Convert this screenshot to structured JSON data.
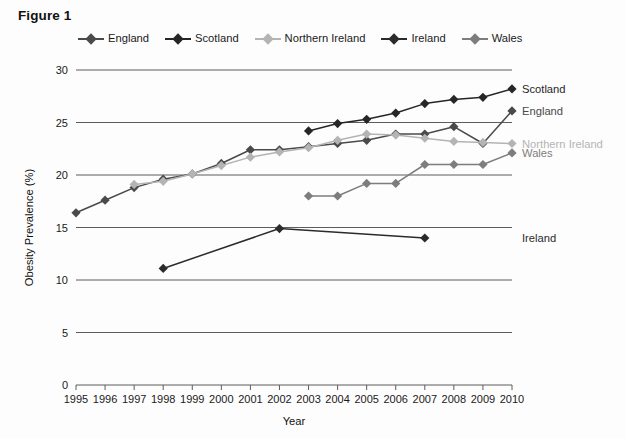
{
  "figure": {
    "title": "Figure 1"
  },
  "legend": {
    "items": [
      {
        "label": "England",
        "color": "#4a4a4a"
      },
      {
        "label": "Scotland",
        "color": "#262626"
      },
      {
        "label": "Northern Ireland",
        "color": "#b4b4b4"
      },
      {
        "label": "Ireland",
        "color": "#2b2b2b"
      },
      {
        "label": "Wales",
        "color": "#7d7d7d"
      }
    ]
  },
  "end_labels": [
    {
      "name": "Scotland",
      "value": 28.2,
      "color": "#262626"
    },
    {
      "name": "England",
      "value": 26.1,
      "color": "#4a4a4a"
    },
    {
      "name": "Northern Ireland",
      "value": 23.0,
      "color": "#b4b4b4"
    },
    {
      "name": "Wales",
      "value": 22.1,
      "color": "#7d7d7d"
    },
    {
      "name": "Ireland",
      "value": 14.0,
      "color": "#2b2b2b"
    }
  ],
  "chart_data": {
    "type": "line",
    "title": "Figure 1",
    "xlabel": "Year",
    "ylabel": "Obesity Prevalence (%)",
    "x": [
      1995,
      1996,
      1997,
      1998,
      1999,
      2000,
      2001,
      2002,
      2003,
      2004,
      2005,
      2006,
      2007,
      2008,
      2009,
      2010
    ],
    "xlim": [
      1995,
      2010
    ],
    "ylim": [
      0,
      30
    ],
    "yticks": [
      0,
      5,
      10,
      15,
      20,
      25,
      30
    ],
    "xticks": [
      "1995",
      "1996",
      "1997",
      "1998",
      "1999",
      "2000",
      "2001",
      "2002",
      "2003",
      "2004",
      "2005",
      "2006",
      "2007",
      "2008",
      "2009",
      "2010"
    ],
    "grid": "horizontal",
    "legend_position": "top",
    "series": [
      {
        "name": "England",
        "color": "#4a4a4a",
        "x": [
          1995,
          1996,
          1997,
          1998,
          1999,
          2000,
          2001,
          2002,
          2003,
          2004,
          2005,
          2006,
          2007,
          2008,
          2009,
          2010
        ],
        "values": [
          16.4,
          17.6,
          18.8,
          19.6,
          20.1,
          21.1,
          22.4,
          22.4,
          22.7,
          23.0,
          23.3,
          23.9,
          23.9,
          24.6,
          23.0,
          26.1
        ]
      },
      {
        "name": "Scotland",
        "color": "#262626",
        "x": [
          2003,
          2004,
          2005,
          2006,
          2007,
          2008,
          2009,
          2010
        ],
        "values": [
          24.2,
          24.9,
          25.3,
          25.9,
          26.8,
          27.2,
          27.4,
          28.2
        ]
      },
      {
        "name": "Northern Ireland",
        "color": "#b4b4b4",
        "x": [
          1997,
          1998,
          1999,
          2000,
          2001,
          2002,
          2003,
          2004,
          2005,
          2006,
          2007,
          2008,
          2009,
          2010
        ],
        "values": [
          19.1,
          19.4,
          20.1,
          20.9,
          21.7,
          22.2,
          22.6,
          23.3,
          23.9,
          23.8,
          23.5,
          23.2,
          23.1,
          23.0
        ]
      },
      {
        "name": "Ireland",
        "color": "#2b2b2b",
        "x": [
          1998,
          2002,
          2007
        ],
        "values": [
          11.1,
          14.9,
          14.0
        ]
      },
      {
        "name": "Wales",
        "color": "#7d7d7d",
        "x": [
          2003,
          2004,
          2005,
          2006,
          2007,
          2008,
          2009,
          2010
        ],
        "values": [
          18.0,
          18.0,
          19.2,
          19.2,
          21.0,
          21.0,
          21.0,
          22.1
        ]
      }
    ]
  }
}
